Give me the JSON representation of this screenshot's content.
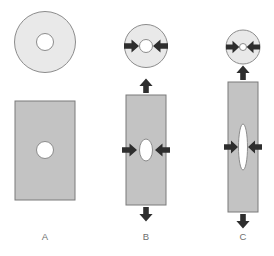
{
  "figure": {
    "title": "",
    "colors": {
      "disc_fill": "#e9e9e9",
      "block_fill": "#c3c3c3",
      "outline": "#8c8c8c",
      "block_outline": "#7a7a7a",
      "hole_fill": "#ffffff",
      "hole_outline": "#8c8c8c",
      "arrow_fill": "#2e2e2e",
      "label_color": "#6e6e6e",
      "background": "#ffffff"
    }
  },
  "columns": [
    {
      "id": "A",
      "label": "A",
      "label_x": 45,
      "label_y": 237,
      "disc": {
        "name": "disc-a",
        "cx": 45,
        "cy": 42,
        "r": 30.5,
        "hole": {
          "rx": 8.5,
          "ry": 8.5
        },
        "arrows": []
      },
      "block": {
        "name": "block-a",
        "x": 15,
        "y": 101,
        "width": 60,
        "height": 99,
        "hole": {
          "cx": 45,
          "cy": 150,
          "rx": 8.5,
          "ry": 8.5
        },
        "arrows": []
      }
    },
    {
      "id": "B",
      "label": "B",
      "label_x": 146,
      "label_y": 237,
      "disc": {
        "name": "disc-b",
        "cx": 146,
        "cy": 46,
        "r": 21.5,
        "hole": {
          "rx": 6.5,
          "ry": 6.5
        },
        "arrows": [
          "left-inward",
          "right-inward"
        ]
      },
      "block": {
        "name": "block-b",
        "x": 126,
        "y": 95,
        "width": 40,
        "height": 110,
        "hole": {
          "cx": 146,
          "cy": 150,
          "rx": 6.5,
          "ry": 11
        },
        "arrows": [
          "left-inward",
          "right-inward",
          "top-outward",
          "bottom-outward"
        ]
      }
    },
    {
      "id": "C",
      "label": "C",
      "label_x": 243,
      "label_y": 237,
      "disc": {
        "name": "disc-c",
        "cx": 243,
        "cy": 47,
        "r": 17,
        "hole": {
          "rx": 3.5,
          "ry": 3.5
        },
        "arrows": [
          "left-inward",
          "right-inward"
        ]
      },
      "block": {
        "name": "block-c",
        "x": 228,
        "y": 82,
        "width": 30,
        "height": 130,
        "hole": {
          "cx": 243,
          "cy": 147,
          "rx": 4.5,
          "ry": 23
        },
        "arrows": [
          "left-inward",
          "right-inward",
          "top-outward",
          "bottom-outward"
        ]
      }
    }
  ]
}
